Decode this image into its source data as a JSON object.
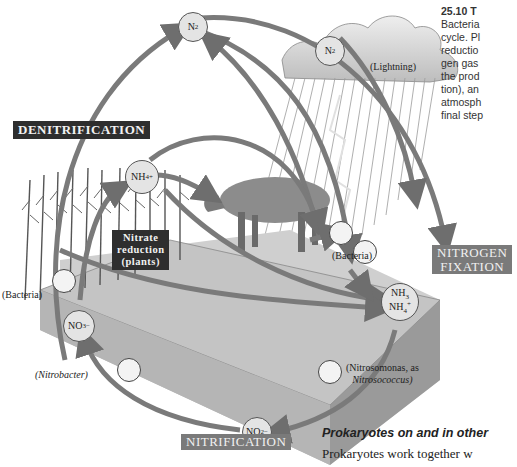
{
  "figure": {
    "caption_lines": [
      "25.10 T",
      "Bacteria",
      "cycle. Pl",
      "reductio",
      "gen gas",
      "the prod",
      "tion), an",
      "atmosph",
      "final step"
    ],
    "caption_number": "25.10"
  },
  "process_labels": {
    "denitrification": "DENITRIFICATION",
    "nitrogen_fixation_line1": "NITROGEN",
    "nitrogen_fixation_line2": "FIXATION",
    "nitrification": "NITRIFICATION",
    "nitrate_reduction_line1": "Nitrate",
    "nitrate_reduction_line2": "reduction",
    "nitrate_reduction_line3": "(plants)"
  },
  "nodes": {
    "n2_top": {
      "base": "N",
      "sub": "2"
    },
    "n2_cloud": {
      "base": "N",
      "sub": "2"
    },
    "nh4_plants": {
      "base": "NH",
      "sub": "4",
      "sup": "+"
    },
    "no3": {
      "base": "NO",
      "sub": "3",
      "sup": "−"
    },
    "nh3_line1": {
      "base": "NH",
      "sub": "3"
    },
    "nh4_line2": {
      "base": "NH",
      "sub": "4",
      "sup": "+"
    },
    "no2": {
      "base": "NO",
      "sub": "2",
      "sup": "−"
    }
  },
  "annotations": {
    "lightning": "(Lightning)",
    "bacteria_left": "(Bacteria)",
    "bacteria_right": "(Bacteria)",
    "nitrobacter": "(Nitrobacter)",
    "nitrosomonas_line1": "(Nitrosomonas, as",
    "nitrosomonas_line2": "Nitrosococcus)"
  },
  "text_below": {
    "heading": "Prokaryotes on and in other",
    "body": "Prokaryotes work together w"
  },
  "colors": {
    "arrow": "#7a7a7a",
    "arrow_edge": "#4a4a4a",
    "soil_left": "#bdbdbd",
    "soil_right": "#9a9a9a",
    "ground_top": "#c9c9c9",
    "dark_label": "#2e2e2e",
    "gray_label": "#7a7a7a",
    "node_fill": "#e4e4e4"
  }
}
